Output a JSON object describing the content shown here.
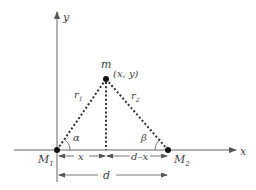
{
  "diagram": {
    "axes": {
      "x_label": "x",
      "y_label": "y"
    },
    "points": {
      "m": {
        "label": "m",
        "coords_label": "(x, y)"
      },
      "M1": {
        "label": "M",
        "subscript": "1"
      },
      "M2": {
        "label": "M",
        "subscript": "2"
      }
    },
    "distances": {
      "r1": {
        "label": "r",
        "subscript": "1"
      },
      "r2": {
        "label": "r",
        "subscript": "2"
      }
    },
    "angles": {
      "alpha": "α",
      "beta": "β"
    },
    "dimensions": {
      "x": "x",
      "d_minus_x": "d–x",
      "d": "d"
    },
    "colors": {
      "line": "#555555",
      "point": "#111111",
      "background": "#ffffff"
    }
  }
}
